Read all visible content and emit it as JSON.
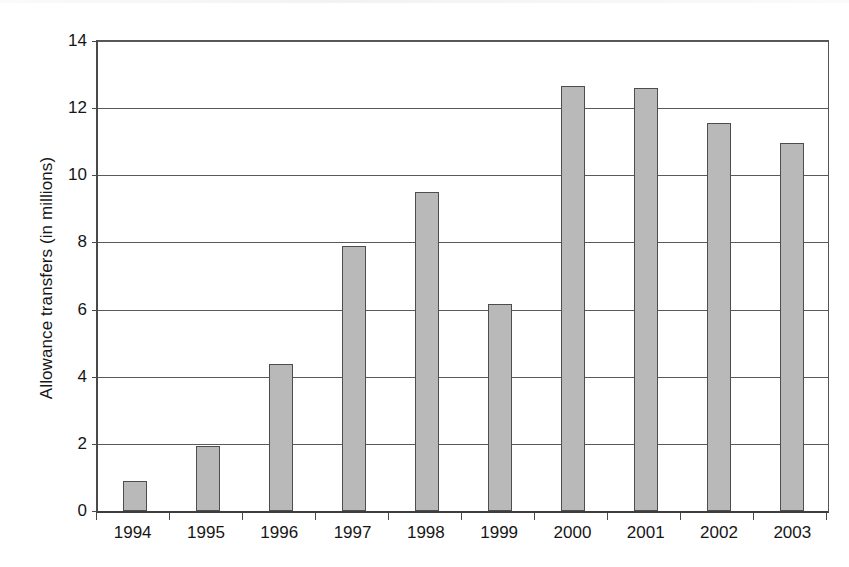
{
  "chart_data": {
    "type": "bar",
    "title": "",
    "xlabel": "",
    "ylabel": "Allowance transfers (in millions)",
    "categories": [
      "1994",
      "1995",
      "1996",
      "1997",
      "1998",
      "1999",
      "2000",
      "2001",
      "2002",
      "2003"
    ],
    "values": [
      0.9,
      1.93,
      4.38,
      7.88,
      9.5,
      6.18,
      12.67,
      12.6,
      11.57,
      10.95
    ],
    "ylim": [
      0,
      14
    ],
    "yticks": [
      0,
      2,
      4,
      6,
      8,
      10,
      12,
      14
    ],
    "ytick_labels": [
      "0",
      "2",
      "4",
      "6",
      "8",
      "10",
      "12",
      "14"
    ],
    "grid": "horizontal",
    "legend": "none",
    "bar_fill_color": "#b9b9b9",
    "bar_border_color": "#4d4d4d",
    "axis_color": "#4a4a4a",
    "background_color": "#ffffff"
  }
}
